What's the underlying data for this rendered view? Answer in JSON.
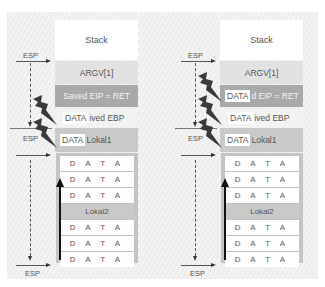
{
  "diagrams": [
    {
      "id": "left",
      "stack_title": "Stack",
      "rows": {
        "argv": "ARGV[1]",
        "saved_eip": "Saved EIP = RET",
        "saved_ebp": "ived EBP",
        "lokal1": "Lokal1"
      },
      "overlays": {
        "ebp": "DATA",
        "lokal1": "DATA"
      },
      "locals": [
        "D A T A",
        "D A T A",
        "D A T A",
        "Lokal2",
        "D A T A",
        "D A T A",
        "D A T A"
      ],
      "esp_labels": [
        "ESP",
        "ESP",
        "ESP"
      ],
      "lightning_count": 2
    },
    {
      "id": "right",
      "stack_title": "Stack",
      "rows": {
        "argv": "ARGV[1]",
        "saved_eip": "d EIP = RET",
        "saved_ebp": "ived EBP",
        "lokal1": "Lokal1"
      },
      "overlays": {
        "eip": "DATA",
        "ebp": "DATA",
        "lokal1": "DATA"
      },
      "locals": [
        "D A T A",
        "D A T A",
        "D A T A",
        "Lokal2",
        "D A T A",
        "D A T A",
        "D A T A"
      ],
      "esp_labels": [
        "ESP",
        "ESP",
        "ESP"
      ],
      "lightning_count": 3
    }
  ],
  "colors": {
    "saved_eip": "#a9a9a9",
    "argv": "#e2e2e2",
    "lokal": "#c9c9c9",
    "frame": "#c4c4c4",
    "bolt": "#3a3a3a"
  }
}
